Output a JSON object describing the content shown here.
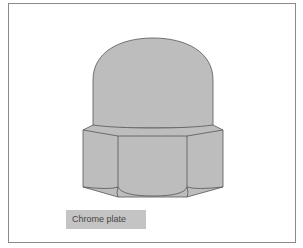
{
  "figure": {
    "fill_color": "#bdbdbd",
    "stroke_color": "#555555",
    "frame_color": "#8a8a8a"
  },
  "label": {
    "text": "Chrome plate",
    "background": "#c4c4c4"
  }
}
